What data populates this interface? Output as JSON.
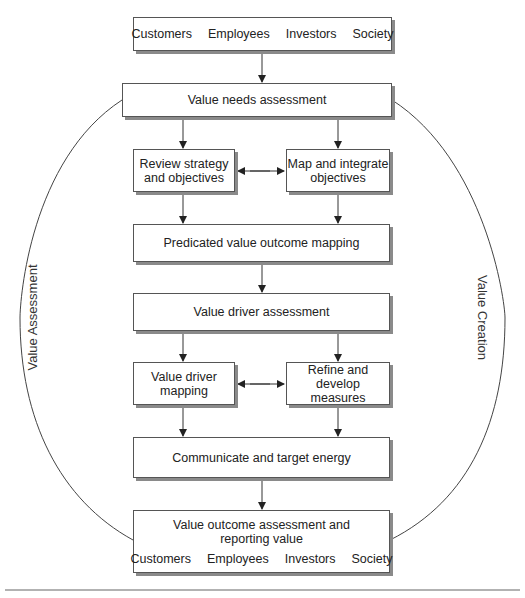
{
  "stakeholders_top": [
    "Customers",
    "Employees",
    "Investors",
    "Society"
  ],
  "boxes": {
    "needs": "Value needs assessment",
    "review_1": "Review strategy",
    "review_2": "and objectives",
    "map_1": "Map and integrate",
    "map_2": "objectives",
    "predicated": "Predicated value outcome mapping",
    "driver_assessment": "Value driver assessment",
    "driver_mapping_1": "Value driver",
    "driver_mapping_2": "mapping",
    "refine_1": "Refine and",
    "refine_2": "develop measures",
    "communicate": "Communicate and target energy",
    "outcome_1": "Value outcome assessment and",
    "outcome_2": "reporting value"
  },
  "stakeholders_bottom": [
    "Customers",
    "Employees",
    "Investors",
    "Society"
  ],
  "side_labels": {
    "left": "Value Assessment",
    "right": "Value Creation"
  }
}
